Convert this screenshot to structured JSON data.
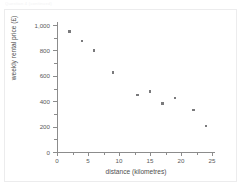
{
  "figure": {
    "header_strip_text": "Question 4 (continued)",
    "background_color": "#ffffff",
    "frame_color": "#ececed",
    "axis_color": "#8c8c8c",
    "marker_color": "#7a7a7c"
  },
  "chart_data": {
    "type": "scatter",
    "title": "",
    "xlabel": "distance (kilometres)",
    "ylabel": "weekly rental price (£)",
    "xlim": [
      0,
      25
    ],
    "ylim": [
      0,
      1000
    ],
    "xticks": [
      0,
      5,
      10,
      15,
      20,
      25
    ],
    "xticklabels": [
      "0",
      "5",
      "10",
      "15",
      "20",
      "25"
    ],
    "xminorticks": [
      2.5,
      7.5,
      12.5,
      17.5,
      22.5
    ],
    "yticks": [
      0,
      200,
      400,
      600,
      800,
      1000
    ],
    "yticklabels": [
      "0",
      "200",
      "400",
      "600",
      "800",
      "1,000"
    ],
    "yminorticks": [
      100,
      300,
      500,
      700,
      900
    ],
    "grid": false,
    "legend": false,
    "marker": "square",
    "series": [
      {
        "name": "properties",
        "points": [
          {
            "x": 2,
            "y": 950
          },
          {
            "x": 4,
            "y": 875
          },
          {
            "x": 6,
            "y": 800
          },
          {
            "x": 9,
            "y": 625
          },
          {
            "x": 13,
            "y": 450
          },
          {
            "x": 15,
            "y": 475
          },
          {
            "x": 17,
            "y": 380
          },
          {
            "x": 19,
            "y": 425
          },
          {
            "x": 22,
            "y": 330
          },
          {
            "x": 24,
            "y": 205
          }
        ]
      }
    ]
  }
}
